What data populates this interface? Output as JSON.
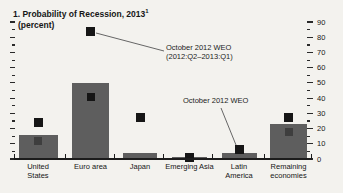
{
  "panel": {
    "title_line1": "1. Probability of Recession, 2013",
    "title_superscript": "1",
    "title_line2": "(percent)"
  },
  "annotations": [
    {
      "line1": "October 2012 WEO",
      "line2": "(2012:Q2–2013:Q1)"
    },
    {
      "line1": "October 2012 WEO",
      "line2": ""
    }
  ],
  "chart_data": {
    "type": "bar",
    "title": "1. Probability of Recession, 2013",
    "subtitle": "(percent)",
    "categories": [
      "United States",
      "Euro area",
      "Japan",
      "Emerging Asia",
      "Latin America",
      "Remaining economies"
    ],
    "category_label_lines": [
      [
        "United",
        "States"
      ],
      [
        "Euro area"
      ],
      [
        "Japan"
      ],
      [
        "Emerging Asia"
      ],
      [
        "Latin",
        "America"
      ],
      [
        "Remaining",
        "economies"
      ]
    ],
    "series": [
      {
        "name": "Probability of recession 2013 (gray bars)",
        "values": [
          16,
          50,
          4,
          1,
          4,
          23
        ]
      },
      {
        "name": "October 2012 WEO (2012:Q2–2013:Q1) (black squares)",
        "values": [
          24,
          84,
          27,
          1,
          6,
          27
        ]
      },
      {
        "name": "Dark inner square markers on bars",
        "values": [
          12,
          41,
          null,
          null,
          null,
          18
        ]
      }
    ],
    "ylim": [
      0,
      90
    ],
    "yticks": [
      90,
      80,
      70,
      60,
      50,
      40,
      30,
      20,
      10,
      0
    ],
    "ytick_minor_step": 5,
    "ytick_side": "right",
    "grid": false,
    "legend_position": "none (annotated with pointer lines)"
  },
  "colors": {
    "background": "#f3f2ee",
    "bar": "#5e5e5e",
    "marker_black_square": "#161616",
    "inner_marker_colors": [
      "#3e3e3e",
      "#151515",
      null,
      null,
      null,
      "#3e3e3e"
    ],
    "axis": "#1c1c1c",
    "annotation_line": "#666666"
  }
}
